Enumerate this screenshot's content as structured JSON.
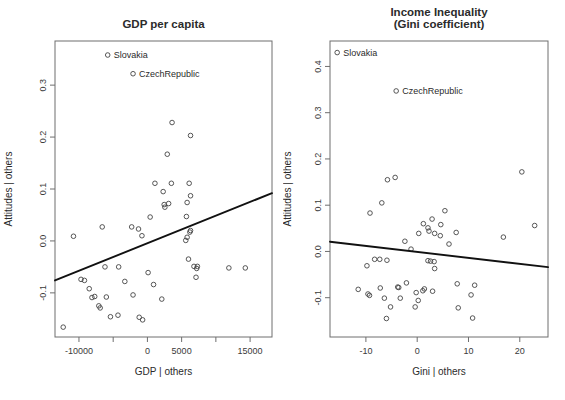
{
  "figure": {
    "background": "#ffffff",
    "point_color": "#444444",
    "line_color": "#111111",
    "frame_color": "#6e6e6e"
  },
  "chart_data": [
    {
      "type": "scatter",
      "panel": "left",
      "title": "GDP per capita",
      "title_line2": "",
      "xlabel": "GDP | others",
      "ylabel": "Attitudes | others",
      "xlim": [
        -13500,
        18200
      ],
      "ylim": [
        -0.185,
        0.385
      ],
      "xticks": [
        -10000,
        -5000,
        0,
        5000,
        10000,
        15000
      ],
      "xticklabels": [
        "-10000",
        "",
        "0",
        "5000",
        "",
        "15000"
      ],
      "yticks": [
        -0.1,
        0.0,
        0.1,
        0.2,
        0.3
      ],
      "yticklabels": [
        "-0.1",
        "0.0",
        "0.1",
        "0.2",
        "0.3"
      ],
      "grid": false,
      "legend": "none",
      "fit_line": {
        "x": [
          -13500,
          18200
        ],
        "y": [
          -0.076,
          0.092
        ]
      },
      "annotations": [
        {
          "label": "Slovakia",
          "x": -5800,
          "y": 0.358
        },
        {
          "label": "CzechRepublic",
          "x": -2100,
          "y": 0.322
        }
      ],
      "x": [
        -5800,
        -2100,
        3600,
        6300,
        2900,
        2300,
        3500,
        6100,
        1100,
        2450,
        2550,
        5800,
        6300,
        400,
        -2300,
        -1300,
        -800,
        -10800,
        -6600,
        3100,
        5700,
        6300,
        6200,
        5600,
        -6200,
        -4200,
        5800,
        6000,
        7300,
        -12300,
        -9200,
        -8500,
        -7700,
        -7100,
        -6900,
        -6000,
        -5400,
        -4300,
        -3300,
        -2100,
        -1200,
        -700,
        100,
        900,
        6800,
        7100,
        7200,
        11900,
        14300,
        -9700,
        -8100,
        2100
      ],
      "y": [
        0.358,
        0.322,
        0.228,
        0.203,
        0.167,
        0.095,
        0.111,
        0.111,
        0.111,
        0.07,
        0.065,
        0.074,
        0.087,
        0.046,
        0.027,
        0.023,
        0.01,
        0.009,
        0.027,
        0.072,
        0.047,
        0.02,
        0.017,
        0.001,
        -0.05,
        -0.05,
        0.007,
        -0.035,
        -0.049,
        -0.166,
        -0.076,
        -0.092,
        -0.107,
        -0.125,
        -0.129,
        -0.108,
        -0.146,
        -0.143,
        -0.078,
        -0.104,
        -0.147,
        -0.152,
        -0.061,
        -0.084,
        -0.049,
        -0.07,
        -0.053,
        -0.052,
        -0.052,
        -0.074,
        -0.109,
        -0.112
      ]
    },
    {
      "type": "scatter",
      "panel": "right",
      "title": "Income Inequality",
      "title_line2": "(Gini coefficient)",
      "xlabel": "Gini | others",
      "ylabel": "Attitudes | others",
      "xlim": [
        -17.0,
        25.5
      ],
      "ylim": [
        -0.185,
        0.455
      ],
      "xticks": [
        -10,
        0,
        10,
        20
      ],
      "xticklabels": [
        "-10",
        "0",
        "10",
        "20"
      ],
      "yticks": [
        -0.1,
        0.0,
        0.1,
        0.2,
        0.3,
        0.4
      ],
      "yticklabels": [
        "-0.1",
        "0.0",
        "0.1",
        "0.2",
        "0.3",
        "0.4"
      ],
      "grid": false,
      "legend": "none",
      "fit_line": {
        "x": [
          -17.0,
          25.5
        ],
        "y": [
          0.021,
          -0.034
        ]
      },
      "annotations": [
        {
          "label": "Slovakia",
          "x": -15.6,
          "y": 0.43
        },
        {
          "label": "CzechRepublic",
          "x": -4.1,
          "y": 0.347
        }
      ],
      "x": [
        -15.6,
        -4.1,
        20.4,
        -5.8,
        -4.3,
        -6.9,
        -9.2,
        2.9,
        5.4,
        1.2,
        2.1,
        4.6,
        0.3,
        2.3,
        3.4,
        4.5,
        7.6,
        22.9,
        16.8,
        6.2,
        -2.4,
        -1.2,
        -5.9,
        -7.3,
        -8.3,
        2.1,
        2.6,
        3.3,
        3.4,
        -11.5,
        -9.8,
        -9.6,
        -9.3,
        -7.2,
        -6.4,
        -3.8,
        -3.6,
        -2.1,
        -0.2,
        1.4,
        3.0,
        7.8,
        11.2,
        10.5,
        -5.2,
        -3.3,
        -0.4,
        0.2,
        1.1,
        8.0,
        10.8,
        -6.0
      ],
      "y": [
        0.43,
        0.347,
        0.172,
        0.155,
        0.16,
        0.105,
        0.083,
        0.07,
        0.088,
        0.06,
        0.051,
        0.058,
        0.039,
        0.044,
        0.039,
        0.034,
        0.041,
        0.056,
        0.031,
        0.016,
        0.022,
        0.005,
        -0.019,
        -0.017,
        -0.017,
        -0.02,
        -0.021,
        -0.022,
        -0.037,
        -0.082,
        -0.031,
        -0.092,
        -0.095,
        -0.079,
        -0.101,
        -0.077,
        -0.078,
        -0.068,
        -0.089,
        -0.081,
        -0.086,
        -0.07,
        -0.073,
        -0.094,
        -0.12,
        -0.101,
        -0.12,
        -0.106,
        -0.085,
        -0.122,
        -0.144,
        -0.145
      ]
    }
  ]
}
